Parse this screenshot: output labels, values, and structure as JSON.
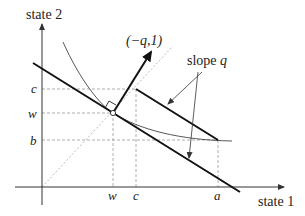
{
  "diagram": {
    "axes": {
      "y_label": "state 2",
      "x_label": "state 1"
    },
    "y_ticks": [
      {
        "label": "c"
      },
      {
        "label": "w"
      },
      {
        "label": "b"
      }
    ],
    "x_ticks": [
      {
        "label": "w"
      },
      {
        "label": "c"
      },
      {
        "label": "a"
      }
    ],
    "vector_label": "(−q,1)",
    "slope_label_prefix": "slope ",
    "slope_label_var": "q",
    "colors": {
      "line": "#111111",
      "curve": "#444444",
      "dashed": "#999999",
      "dotted": "#bbbbbb"
    }
  }
}
